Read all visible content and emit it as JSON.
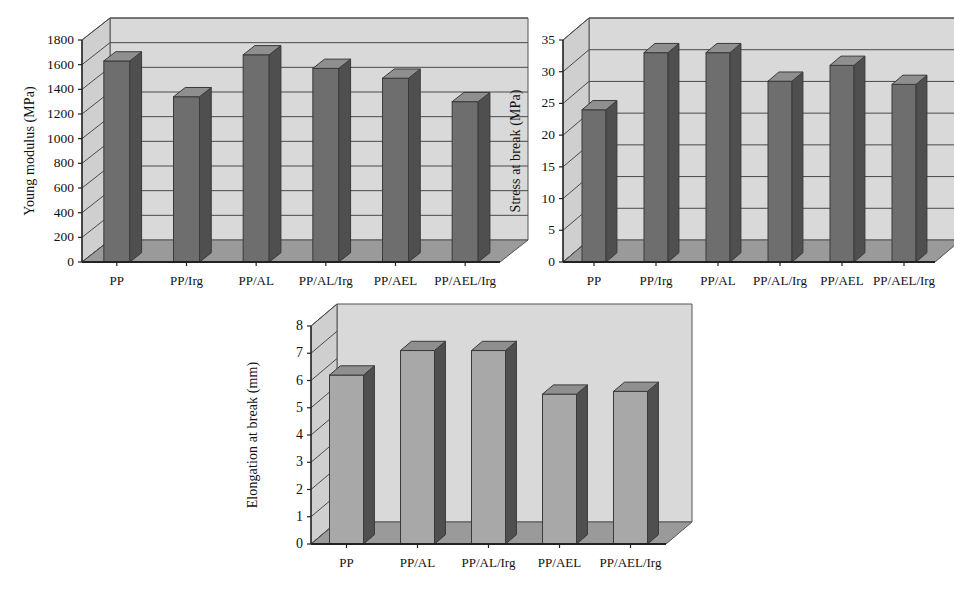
{
  "figure": {
    "background": "#ffffff",
    "panel_fill": "#d9d9d9",
    "panel_top_fill": "#cfcfcf",
    "floor_fill": "#9a9a9a",
    "bar_front_light": "#a8a8a8",
    "bar_front_dark": "#6e6e6e",
    "bar_side_dark": "#4f4f4f",
    "bar_top": "#8f8f8f",
    "gridline_color": "#4a4a4a",
    "axis_color": "#222222"
  },
  "chart_data": [
    {
      "id": "young-modulus",
      "type": "bar",
      "title": "",
      "xlabel": "",
      "ylabel": "Young modulus (MPa)",
      "categories": [
        "PP",
        "PP/Irg",
        "PP/AL",
        "PP/AL/Irg",
        "PP/AEL",
        "PP/AEL/Irg"
      ],
      "values": [
        1630,
        1340,
        1680,
        1570,
        1490,
        1300
      ],
      "yticks": [
        0,
        200,
        400,
        600,
        800,
        1000,
        1200,
        1400,
        1600,
        1800
      ],
      "ytick_labels": [
        "0",
        "200",
        "400",
        "600",
        "800",
        "1000",
        "1200",
        "1400",
        "1600",
        "1800"
      ],
      "ylim": [
        0,
        1800
      ],
      "grid": true,
      "legend": "none",
      "bar_shade": "dark",
      "three_d": true
    },
    {
      "id": "stress-at-break",
      "type": "bar",
      "title": "",
      "xlabel": "",
      "ylabel": "Stress at break (MPa)",
      "categories": [
        "PP",
        "PP/Irg",
        "PP/AL",
        "PP/AL/Irg",
        "PP/AEL",
        "PP/AEL/Irg"
      ],
      "values": [
        24,
        33,
        33,
        28.5,
        31,
        28
      ],
      "yticks": [
        0,
        5,
        10,
        15,
        20,
        25,
        30,
        35
      ],
      "ytick_labels": [
        "0",
        "5",
        "10",
        "15",
        "20",
        "25",
        "30",
        "35"
      ],
      "ylim": [
        0,
        35
      ],
      "grid": true,
      "legend": "none",
      "bar_shade": "dark",
      "three_d": true
    },
    {
      "id": "elongation-at-break",
      "type": "bar",
      "title": "",
      "xlabel": "",
      "ylabel": "Elongation at break (mm)",
      "categories": [
        "PP",
        "PP/AL",
        "PP/AL/Irg",
        "PP/AEL",
        "PP/AEL/Irg"
      ],
      "values": [
        6.2,
        7.1,
        7.1,
        5.5,
        5.6
      ],
      "yticks": [
        0,
        1,
        2,
        3,
        4,
        5,
        6,
        7,
        8
      ],
      "ytick_labels": [
        "0",
        "1",
        "2",
        "3",
        "4",
        "5",
        "6",
        "7",
        "8"
      ],
      "ylim": [
        0,
        8
      ],
      "grid": false,
      "legend": "none",
      "bar_shade": "light",
      "three_d": true
    }
  ]
}
